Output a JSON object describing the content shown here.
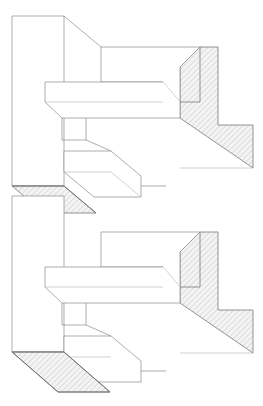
{
  "document": {
    "title": "Isometric Section Detail",
    "type": "line-drawing",
    "width": 263,
    "height": 406,
    "background_color": "#ffffff",
    "line_color": "#8a8a8a",
    "strong_line_color": "#6d6d6d",
    "hatch_color": "#9b9b9b",
    "hatch_fill_color": "#f2f2f2",
    "module_count": 2,
    "module_vertical_offset": 185
  },
  "style": {
    "edge_stroke_width": 0.7,
    "strong_stroke_width": 0.9,
    "hatch_spacing": 4,
    "hatch_angle_degrees": 45
  },
  "geometry": {
    "module_a": {
      "name": "upper-module",
      "offset_y": 0,
      "column": {
        "name": "vertical-column",
        "front_face": "12,16 64,16 64,186 12,186",
        "top_edge": "12,16 64,16",
        "right_edge": "64,16 64,186"
      },
      "top_chamfer": {
        "name": "top-chamfer-diagonal",
        "path": "64,16 101,47"
      },
      "upper_slab": {
        "name": "upper-horizontal-slab",
        "top_face": "101,47 200,47",
        "front_face": "101,47 101,82 163,82 180,102 180,67 200,47",
        "left_edge": "101,47 101,82",
        "bottom_edge": "101,82 163,82",
        "notch_diagonal": "163,82 180,102",
        "notch_vertical": "180,102 180,67"
      },
      "lower_slab": {
        "name": "lower-horizontal-slab",
        "outline": "45,82 163,82 180,102 180,118 62,118 45,102",
        "top_edge": "45,82 163,82",
        "left_edge": "45,82 45,102",
        "bottom_front": "62,118 180,118",
        "right_edge": "180,102 180,118",
        "left_diagonal": "45,102 62,118",
        "inner_top": "45,102 163,102"
      },
      "step_block": {
        "name": "step-riser-block",
        "outline": "62,118 86,118 86,140 62,140",
        "riser_left": "62,118 62,140",
        "riser_top": "62,118 86,118"
      },
      "angled_block": {
        "name": "angled-parallelogram-block",
        "top_face": "64,151 111,151 141,176 94,176",
        "front_face": "64,151 64,172 94,197 141,197 141,176",
        "left_edge": "64,151 64,172",
        "bottom_edge": "64,172 94,197",
        "front_bottom": "94,197 141,197",
        "right_edge": "141,176 141,197",
        "fold_line": "64,172 111,172",
        "diagonal_a": "86,140 111,151",
        "diagonal_b": "141,176 166,186"
      },
      "wedge": {
        "name": "hatched-section-wedge",
        "polygon": "200,47 218,47 218,125 253,125 253,168 180,118 180,67",
        "notch_polygon": "180,67 200,47 200,102 180,102",
        "hatch": true
      },
      "base_strip": {
        "name": "hatched-base-strip",
        "polygon": "12,186 64,186 96,213 44,213",
        "hatch": true
      },
      "reference_lines": [
        "141,186 166,186",
        "166,186 166,168",
        "180,168 253,168"
      ]
    },
    "module_b": {
      "name": "lower-module",
      "offset_y": 185,
      "column": {
        "name": "vertical-column",
        "front_face": "12,196 64,196 64,352 12,352",
        "top_edge": "12,196 64,196",
        "right_edge": "64,196 64,352"
      },
      "base_hatch": {
        "name": "hatched-bottom-face",
        "polygon": "12,352 64,352 110,392 58,392",
        "hatch": true
      }
    }
  },
  "annotations": {
    "visible_text": [],
    "labels": [],
    "dimensions": []
  }
}
